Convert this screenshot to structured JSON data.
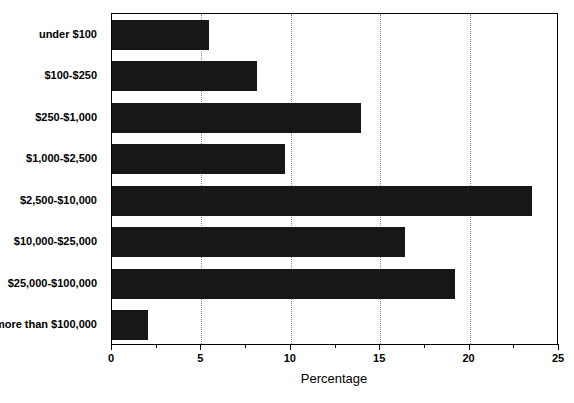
{
  "chart_data": {
    "type": "bar",
    "orientation": "horizontal",
    "title": "",
    "subtitle": "",
    "xlabel": "Percentage",
    "ylabel": "",
    "categories": [
      "under $100",
      "$100-$250",
      "$250-$1,000",
      "$1,000-$2,500",
      "$2,500-$10,000",
      "$10,000-$25,000",
      "$25,000-$100,000",
      "more than $100,000"
    ],
    "values": [
      5.4,
      8.1,
      13.9,
      9.7,
      23.5,
      16.4,
      19.2,
      2.0
    ],
    "xlim": [
      0,
      25
    ],
    "xticks": [
      0,
      5,
      10,
      15,
      20,
      25
    ],
    "xtick_labels": [
      "0",
      "5",
      "10",
      "15",
      "20",
      "25"
    ],
    "xminor_ticks": [
      2.5,
      7.5,
      12.5,
      17.5,
      22.5
    ],
    "gridlines_x": [
      5,
      10,
      15,
      20
    ],
    "grid": true,
    "grid_style": "dotted",
    "legend": null,
    "legend_position": "none",
    "bar_color": "#171717",
    "grid_color": "#8a8a8a",
    "axis_color": "#000000",
    "background_color": "#ffffff"
  }
}
